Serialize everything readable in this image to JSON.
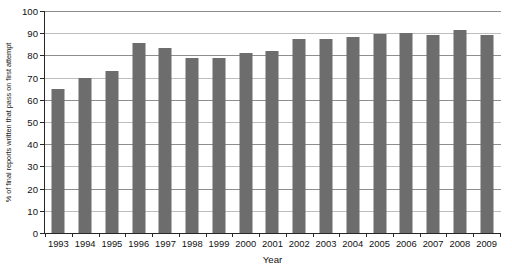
{
  "chart_data": {
    "type": "bar",
    "title": "",
    "xlabel": "Year",
    "ylabel": "% of final reports written that pass on first attempt",
    "ylim": [
      0,
      100
    ],
    "ytick_step": 10,
    "yticks": [
      0,
      10,
      20,
      30,
      40,
      50,
      60,
      70,
      80,
      90,
      100
    ],
    "grid": true,
    "legend": "none",
    "bar_color": "#6d6d6d",
    "categories": [
      "1993",
      "1994",
      "1995",
      "1996",
      "1997",
      "1998",
      "1999",
      "2000",
      "2001",
      "2002",
      "2003",
      "2004",
      "2005",
      "2006",
      "2007",
      "2008",
      "2009"
    ],
    "values": [
      65,
      70,
      73,
      85.5,
      83.5,
      79,
      79,
      81,
      82,
      87.5,
      87.5,
      88.5,
      89.5,
      90,
      89,
      91.5,
      89
    ]
  },
  "axes": {
    "y_title": "% of final reports written that pass on first attempt",
    "x_title": "Year"
  },
  "title_sliver": ""
}
